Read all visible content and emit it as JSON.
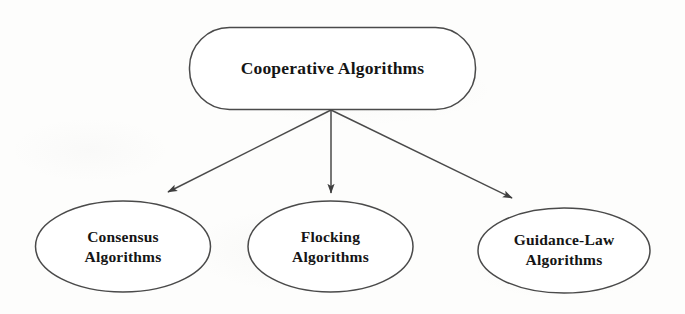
{
  "diagram": {
    "type": "hierarchy-tree",
    "style": {
      "background_color": "#fdfdfc",
      "stroke_color": "#4a4a4a",
      "text_color": "#151515",
      "fill_color": "#ffffff"
    },
    "root": {
      "id": "cooperative-algorithms",
      "label": "Cooperative Algorithms",
      "shape": "rounded-rectangle"
    },
    "children": [
      {
        "id": "consensus-algorithms",
        "shape": "ellipse",
        "line1": "Consensus",
        "line2": "Algorithms"
      },
      {
        "id": "flocking-algorithms",
        "shape": "ellipse",
        "line1": "Flocking",
        "line2": "Algorithms"
      },
      {
        "id": "guidance-law-algorithms",
        "shape": "ellipse",
        "line1": "Guidance-Law",
        "line2": "Algorithms"
      }
    ],
    "connectors": [
      {
        "id": "connector-root-to-consensus",
        "from": "cooperative-algorithms",
        "to": "consensus-algorithms",
        "arrowhead": "filled-triangle"
      },
      {
        "id": "connector-root-to-flocking",
        "from": "cooperative-algorithms",
        "to": "flocking-algorithms",
        "arrowhead": "filled-triangle"
      },
      {
        "id": "connector-root-to-guidance-law",
        "from": "cooperative-algorithms",
        "to": "guidance-law-algorithms",
        "arrowhead": "filled-triangle"
      }
    ]
  }
}
